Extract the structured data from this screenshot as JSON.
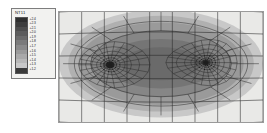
{
  "legend": {
    "title": "NT11",
    "entries": [
      {
        "color": "#2e2e2e",
        "label": "+2.4"
      },
      {
        "color": "#3d3d3d",
        "label": "+2.3"
      },
      {
        "color": "#4d4d4d",
        "label": "+2.1"
      },
      {
        "color": "#5c5c5c",
        "label": "+2.0"
      },
      {
        "color": "#6b6b6b",
        "label": "+1.9"
      },
      {
        "color": "#7a7a7a",
        "label": "+1.8"
      },
      {
        "color": "#8a8a8a",
        "label": "+1.7"
      },
      {
        "color": "#9a9a9a",
        "label": "+1.6"
      },
      {
        "color": "#a9a9a9",
        "label": "+1.5"
      },
      {
        "color": "#b8b8b8",
        "label": "+1.4"
      },
      {
        "color": "#c8c8c8",
        "label": "+1.3"
      },
      {
        "color": "#3a3a3a",
        "label": "+1.2"
      }
    ]
  },
  "chart_data": {
    "type": "heatmap",
    "title": "NT11",
    "xlabel": "",
    "ylabel": "",
    "grid": true,
    "legend_position": "left",
    "colormap": "grayscale",
    "field": "nodal temperature",
    "levels": [
      1.2,
      1.3,
      1.4,
      1.5,
      1.6,
      1.7,
      1.8,
      1.9,
      2.0,
      2.1,
      2.3,
      2.4
    ],
    "level_colors": [
      "#3a3a3a",
      "#c8c8c8",
      "#b8b8b8",
      "#a9a9a9",
      "#9a9a9a",
      "#8a8a8a",
      "#7a7a7a",
      "#6b6b6b",
      "#5c5c5c",
      "#4d4d4d",
      "#3d3d3d",
      "#2e2e2e"
    ],
    "domain": {
      "x": [
        0,
        206
      ],
      "y": [
        0,
        112
      ]
    },
    "focal_points": [
      {
        "x_frac": 0.25,
        "y_frac": 0.48,
        "label": "hot-spot-left"
      },
      {
        "x_frac": 0.72,
        "y_frac": 0.46,
        "label": "hot-spot-right"
      }
    ],
    "contour_bands": [
      {
        "level": 1.3,
        "rx_frac": 0.5,
        "ry_frac": 0.49,
        "color": "#c8c8c8"
      },
      {
        "level": 1.5,
        "rx_frac": 0.455,
        "ry_frac": 0.435,
        "color": "#b0b0b0"
      },
      {
        "level": 1.7,
        "rx_frac": 0.405,
        "ry_frac": 0.375,
        "color": "#9a9a9a"
      },
      {
        "level": 1.9,
        "rx_frac": 0.345,
        "ry_frac": 0.305,
        "color": "#868686"
      },
      {
        "level": 2.1,
        "rx_frac": 0.275,
        "ry_frac": 0.225,
        "color": "#757575"
      },
      {
        "level": 2.3,
        "rx_frac": 0.195,
        "ry_frac": 0.15,
        "color": "#6a6a6a"
      }
    ]
  }
}
